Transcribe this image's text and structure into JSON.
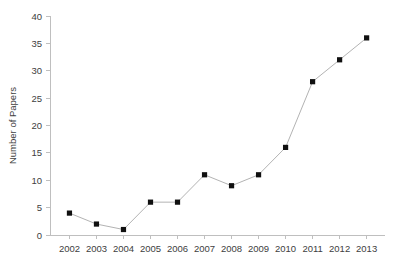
{
  "chart_data": {
    "type": "line",
    "title": "",
    "xlabel": "",
    "ylabel": "Number of Papers",
    "categories": [
      "2002",
      "2003",
      "2004",
      "2005",
      "2006",
      "2007",
      "2008",
      "2009",
      "2010",
      "2011",
      "2012",
      "2013"
    ],
    "values": [
      4,
      2,
      1,
      6,
      6,
      11,
      9,
      11,
      16,
      28,
      32,
      36
    ],
    "series": [
      {
        "name": "Number of Papers",
        "values": [
          4,
          2,
          1,
          6,
          6,
          11,
          9,
          11,
          16,
          28,
          32,
          36
        ]
      }
    ],
    "yticks": [
      0,
      5,
      10,
      15,
      20,
      25,
      30,
      35,
      40
    ],
    "ytick_labels": [
      "0",
      "5",
      "10",
      "15",
      "20",
      "25",
      "30",
      "35",
      "40"
    ],
    "ylim": [
      0,
      40
    ],
    "grid": false,
    "legend": false,
    "legend_position": "none",
    "marker": "square",
    "line_color": "#b3b3b3",
    "marker_color": "#101010",
    "axis_color": "#bfbfbf",
    "text_color": "#404040"
  }
}
